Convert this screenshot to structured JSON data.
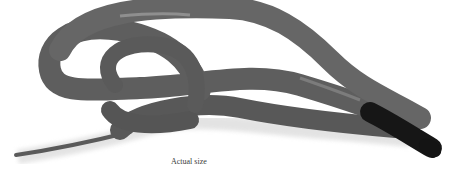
{
  "image": {
    "subject": "snake photograph",
    "description": "A gray-bodied snake coiled in loops with a black head and neck, on a white background",
    "colors": {
      "background": "#ffffff",
      "body": "#6a6a6a",
      "body_shadow": "#4a4a4a",
      "head": "#1a1a1a"
    }
  },
  "caption": {
    "text": "Actual size"
  }
}
